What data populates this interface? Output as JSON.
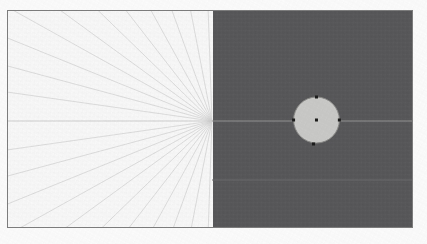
{
  "canvas": {
    "title": "drawing-canvas",
    "width": 427,
    "height": 244,
    "frame": {
      "label": "drawing-frame",
      "x": 7,
      "y": 10,
      "width": 406,
      "height": 218,
      "border_color": "#7d7d7d",
      "border_width": 1
    },
    "regions": [
      {
        "name": "light-region",
        "label": "Light half",
        "fill": "#fafafa",
        "x": 0,
        "y": 0,
        "width": 205,
        "height": 216
      },
      {
        "name": "dark-region",
        "label": "Dark half",
        "fill": "#58585a",
        "x": 205,
        "y": 0,
        "width": 201,
        "height": 216
      }
    ],
    "divider": {
      "name": "region-divider",
      "label": "Region boundary",
      "x": 205,
      "color": "#58585a"
    }
  },
  "guides": {
    "horizontal_axis": {
      "name": "horizontal-axis-line",
      "label": "Horizontal centre axis",
      "y": 110,
      "x1": 0,
      "x2": 406,
      "color_light": "#c9c9c9",
      "color_dark": "#9a9a9c"
    },
    "secondary_line": {
      "name": "secondary-guide-line",
      "label": "Lower guide line",
      "y": 169,
      "x1": 205,
      "x2": 406,
      "color": "#6a6a6c"
    },
    "fan": {
      "name": "radial-construction-lines",
      "label": "Radial construction fan",
      "origin_x": 205,
      "origin_y": 110,
      "color": "#d0d0d0",
      "stroke_width": 0.7,
      "count": 22,
      "angles_deg": [
        -88,
        -79,
        -70,
        -61,
        -52,
        -44,
        -36,
        -29,
        -22,
        -15,
        -8,
        8,
        15,
        22,
        29,
        36,
        44,
        52,
        61,
        70,
        79,
        88
      ]
    }
  },
  "shape": {
    "name": "selected-circle",
    "label": "Circle",
    "type": "circle",
    "center_x": 310,
    "center_y": 109,
    "radius": 23,
    "fill": "#c9c9c7",
    "stroke": "#8a8a88",
    "stroke_width": 1,
    "selected": true
  },
  "handles": {
    "name": "selection-handles",
    "label": "Selection handles",
    "color": "#1c1c1c",
    "size": 3,
    "center_dot": {
      "name": "center-point-handle",
      "label": "Centre point",
      "x": 310,
      "y": 109
    },
    "points": [
      {
        "name": "handle-top",
        "label": "Top handle",
        "x": 310,
        "y": 86
      },
      {
        "name": "handle-right",
        "label": "Right handle",
        "x": 333,
        "y": 109
      },
      {
        "name": "handle-bottom",
        "label": "Bottom handle",
        "x": 307,
        "y": 133
      },
      {
        "name": "handle-left",
        "label": "Left handle",
        "x": 287,
        "y": 109
      }
    ]
  }
}
